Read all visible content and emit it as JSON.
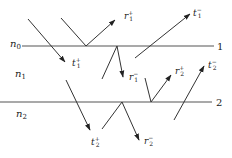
{
  "diagram": {
    "type": "multilayer reflection/transmission ray diagram",
    "media": [
      {
        "id": "n0",
        "base": "n",
        "sub": "0"
      },
      {
        "id": "n1",
        "base": "n",
        "sub": "1"
      },
      {
        "id": "n2",
        "base": "n",
        "sub": "2"
      }
    ],
    "interfaces": [
      {
        "id": "interface-1",
        "label": "1"
      },
      {
        "id": "interface-2",
        "label": "2"
      }
    ],
    "waves": [
      {
        "id": "t1-plus",
        "base": "t",
        "sub": "1",
        "sup": "+"
      },
      {
        "id": "r1-plus",
        "base": "r",
        "sub": "1",
        "sup": "+"
      },
      {
        "id": "t1-minus",
        "base": "t",
        "sub": "1",
        "sup": "−"
      },
      {
        "id": "r1-minus",
        "base": "r",
        "sub": "1",
        "sup": "−"
      },
      {
        "id": "r2-plus",
        "base": "r",
        "sub": "2",
        "sup": "+"
      },
      {
        "id": "t2-minus",
        "base": "t",
        "sub": "2",
        "sup": "−"
      },
      {
        "id": "t2-plus",
        "base": "t",
        "sub": "2",
        "sup": "+"
      },
      {
        "id": "r2-minus",
        "base": "r",
        "sub": "2",
        "sup": "−"
      }
    ]
  }
}
